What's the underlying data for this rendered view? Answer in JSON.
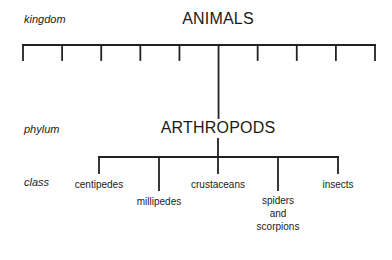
{
  "ranks": {
    "kingdom": "kingdom",
    "phylum": "phylum",
    "class": "class"
  },
  "kingdom_node": {
    "label": "ANIMALS",
    "branch_count": 10,
    "highlighted_branch_index": 5
  },
  "phylum_node": {
    "label": "ARTHROPODS"
  },
  "classes": [
    {
      "label": "centipedes"
    },
    {
      "label": "millipedes"
    },
    {
      "label": "crustaceans"
    },
    {
      "label": "spiders\nand\nscorpions"
    },
    {
      "label": "insects"
    }
  ]
}
